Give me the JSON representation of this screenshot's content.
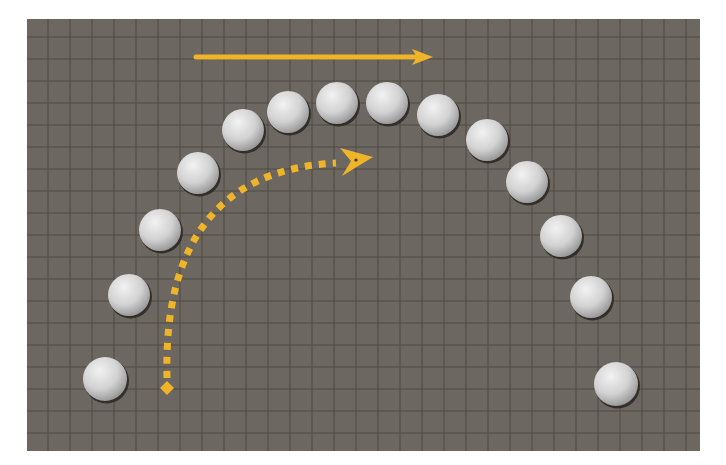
{
  "figure": {
    "width": 726,
    "height": 465,
    "background": "#ffffff"
  },
  "panel": {
    "x": 27,
    "y": 19,
    "width": 673,
    "height": 432,
    "fill": "#6c6861",
    "grid": {
      "spacing": 22,
      "offset_x": 21,
      "offset_y": 18,
      "line_color": "#4f4b45"
    }
  },
  "colors": {
    "arrow": "#f0b429",
    "ball_highlight": "#f2f2f2",
    "ball_mid": "#d2d2d2",
    "ball_shadow": "#8e8e8e",
    "ball_outline": "#2a2622"
  },
  "balls": [
    {
      "x": 105,
      "y": 379,
      "r": 22
    },
    {
      "x": 129,
      "y": 295,
      "r": 21
    },
    {
      "x": 160,
      "y": 230,
      "r": 21
    },
    {
      "x": 198,
      "y": 173,
      "r": 21
    },
    {
      "x": 243,
      "y": 130,
      "r": 21
    },
    {
      "x": 288,
      "y": 112,
      "r": 21
    },
    {
      "x": 337,
      "y": 103,
      "r": 21
    },
    {
      "x": 387,
      "y": 103,
      "r": 21
    },
    {
      "x": 438,
      "y": 115,
      "r": 21
    },
    {
      "x": 487,
      "y": 140,
      "r": 21
    },
    {
      "x": 527,
      "y": 182,
      "r": 21
    },
    {
      "x": 561,
      "y": 236,
      "r": 21
    },
    {
      "x": 591,
      "y": 297,
      "r": 21
    },
    {
      "x": 616,
      "y": 384,
      "r": 22
    }
  ],
  "straight_arrow": {
    "x1": 196,
    "y1": 57,
    "x2": 414,
    "y2": 57,
    "head_tip_x": 433,
    "stroke_width": 5,
    "direction": "right"
  },
  "curved_arrow": {
    "start": {
      "x": 167,
      "y": 388
    },
    "control": {
      "x": 162,
      "y": 172
    },
    "end": {
      "x": 342,
      "y": 161
    },
    "head_tip": {
      "x": 373,
      "y": 157
    },
    "stroke_width": 7,
    "dash": "7 7",
    "start_marker": "diamond",
    "style": "dotted"
  }
}
